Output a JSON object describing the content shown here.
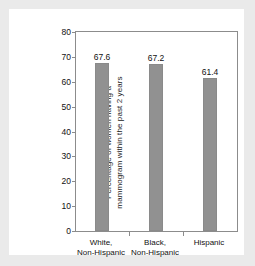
{
  "chart_data": {
    "type": "bar",
    "title": "",
    "subtitle": "",
    "xlabel": "",
    "ylabel": "Percentage of women having a mammogram within the past 2 years",
    "ylabel_lines": [
      "Percentage of women having a",
      "mammogram within the past 2 years"
    ],
    "categories": [
      "White, Non-Hispanic",
      "Black, Non-Hispanic",
      "Hispanic"
    ],
    "category_lines": [
      [
        "White,",
        "Non-Hispanic"
      ],
      [
        "Black,",
        "Non-Hispanic"
      ],
      [
        "Hispanic"
      ]
    ],
    "values": [
      67.6,
      67.2,
      61.4
    ],
    "value_labels": [
      "67.6",
      "67.2",
      "61.4"
    ],
    "ylim": [
      0,
      80
    ],
    "ytick_values": [
      80,
      70,
      60,
      50,
      40,
      30,
      20,
      10,
      0
    ],
    "ytick_labels": [
      "80",
      "70",
      "60",
      "50",
      "40",
      "30",
      "20",
      "10",
      "0"
    ],
    "grid": false,
    "legend": false,
    "legend_position": "none",
    "colors": {
      "bar_fill": "#919191",
      "bar_edge": "#8a8a8a",
      "plot_background": "#ffffff",
      "page_background": "#eaeaea",
      "axis_line": "#8c8c8c",
      "text": "#111111"
    }
  }
}
